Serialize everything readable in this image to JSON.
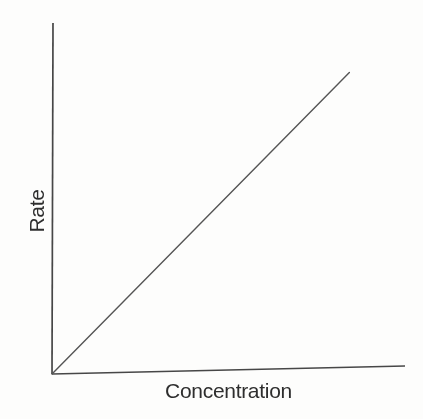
{
  "chart_data": {
    "type": "line",
    "title": "",
    "xlabel": "Concentration",
    "ylabel": "Rate",
    "xlim": [
      0,
      1
    ],
    "ylim": [
      0,
      1
    ],
    "x_tick_labels": [],
    "y_tick_labels": [],
    "grid": false,
    "legend": "none",
    "series": [
      {
        "name": "rate",
        "points": [
          [
            0,
            0
          ],
          [
            0.84,
            0.84
          ]
        ]
      }
    ],
    "colors": {
      "axis": "#474747",
      "line": "#555555",
      "text": "#2e2e2e",
      "background": "#fdfdfc"
    }
  }
}
